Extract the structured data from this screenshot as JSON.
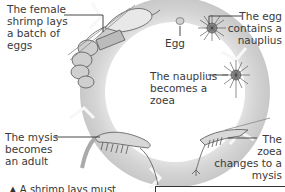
{
  "stages": [
    {
      "id": "adult-female",
      "label": "The female shrimp lays a batch of eggs",
      "lines": [
        "The female",
        "shrimp lays",
        "a batch of",
        "eggs"
      ]
    },
    {
      "id": "egg",
      "label": "Egg",
      "lines": [
        "Egg"
      ]
    },
    {
      "id": "nauplius-egg",
      "label": "The egg contains a nauplius",
      "lines": [
        "The egg",
        "contains a",
        "nauplius"
      ]
    },
    {
      "id": "nauplius",
      "label": "The nauplius becomes a zoea",
      "lines": [
        "The nauplius",
        "becomes a",
        "zoea"
      ]
    },
    {
      "id": "zoea",
      "label": "The zoea changes to a mysis",
      "lines": [
        "The",
        "zoea",
        "changes to a",
        "mysis"
      ]
    },
    {
      "id": "mysis",
      "label": "The mysis becomes an adult",
      "lines": [
        "The mysis",
        "becomes",
        "an adult"
      ]
    }
  ],
  "caption": "▲ A shrimp lays must",
  "colors": {
    "ring": "#d9d9d9",
    "ring_shadow": "#c4c4c4",
    "arrow": "#f4f4f4",
    "text": "#3a3a3a",
    "leader_line": "#333333"
  }
}
